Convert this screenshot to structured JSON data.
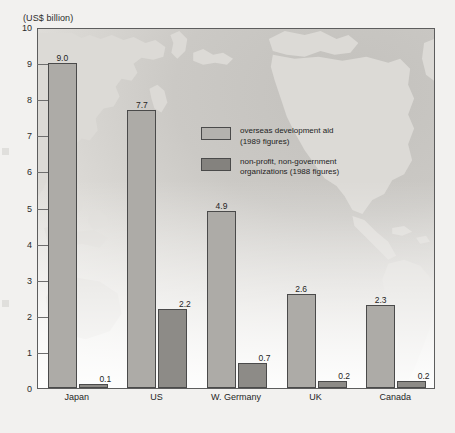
{
  "figure": {
    "unit_label": "(US$ billion)"
  },
  "chart_data": {
    "type": "bar",
    "title": "",
    "xlabel": "",
    "ylabel": "(US$ billion)",
    "ylim": [
      0,
      10
    ],
    "yticks": [
      0,
      1,
      2,
      3,
      4,
      5,
      6,
      7,
      8,
      9,
      10
    ],
    "ytick_labels": [
      "0",
      "1",
      "2",
      "3",
      "4",
      "5",
      "6",
      "7",
      "8",
      "9",
      "10"
    ],
    "grid": false,
    "legend_position": "inside-upper-right",
    "categories": [
      "Japan",
      "US",
      "W. Germany",
      "UK",
      "Canada"
    ],
    "series": [
      {
        "name": "overseas development aid (1989 figures)",
        "legend_line1": "overseas development aid",
        "legend_line2": "(1989 figures)",
        "color": "#adaba7",
        "values": [
          9.0,
          7.7,
          4.9,
          2.6,
          2.3
        ],
        "value_labels": [
          "9.0",
          "7.7",
          "4.9",
          "2.6",
          "2.3"
        ]
      },
      {
        "name": "non-profit, non-government organizations (1988 figures)",
        "legend_line1": "non-profit, non-government",
        "legend_line2": "organizations (1988 figures)",
        "color": "#8d8b87",
        "values": [
          0.1,
          2.2,
          0.7,
          0.2,
          0.2
        ],
        "value_labels": [
          "0.1",
          "2.2",
          "0.7",
          "0.2",
          "0.2"
        ]
      }
    ],
    "background": "world map (Pacific-centred), light grey landmasses on grey ocean"
  },
  "colors": {
    "page_background": "#f2f1ef",
    "plot_border": "#5d5d5d",
    "bar_outline": "#4a4a4a",
    "oda_fill": "#adaba7",
    "ngo_fill": "#8d8b87",
    "land": "#dcdad6",
    "text": "#1f1f1f"
  }
}
